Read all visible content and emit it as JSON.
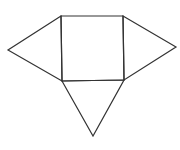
{
  "diagram": {
    "type": "geometric-net",
    "stroke_color": "#333333",
    "background_color": "#ffffff",
    "shapes": {
      "square": {
        "top_left": [
          61,
          16
        ],
        "top_right": [
          123,
          16
        ],
        "bottom_right": [
          124,
          80
        ],
        "bottom_left": [
          62,
          81
        ]
      },
      "left_triangle": {
        "apex": [
          8,
          50
        ],
        "base_top": [
          61,
          16
        ],
        "base_bottom": [
          62,
          81
        ]
      },
      "right_triangle": {
        "apex": [
          176,
          47
        ],
        "base_top": [
          123,
          16
        ],
        "base_bottom": [
          124,
          80
        ]
      },
      "bottom_triangle": {
        "apex": [
          93,
          136
        ],
        "base_left": [
          62,
          81
        ],
        "base_right": [
          124,
          80
        ]
      }
    }
  }
}
